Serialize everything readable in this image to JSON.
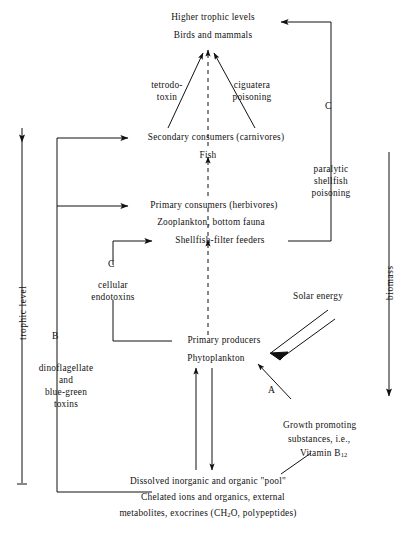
{
  "figure": {
    "type": "flow-diagram",
    "background": "#ffffff",
    "ink": "#111111"
  },
  "axes": {
    "left": {
      "label": "trophic level",
      "direction": "up"
    },
    "right": {
      "label": "biomass",
      "direction": "down"
    }
  },
  "nodes": {
    "higher_trophic": "Higher trophic levels",
    "birds_mammals": "Birds and mammals",
    "secondary_consumers": "Secondary consumers (carnivores)",
    "fish": "Fish",
    "primary_consumers": "Primary consumers (herbivores)",
    "zooplankton": "Zooplankton, bottom fauna",
    "shellfish_filter": "Shellfish-filter feeders",
    "primary_producers": "Primary producers",
    "phytoplankton": "Phytoplankton",
    "pool_line1": "Dissolved inorganic and organic \"pool\"",
    "pool_line2": "Chelated ions and organics, external",
    "pool_line3_pre": "metabolites, exocrines (CH",
    "pool_line3_sub": "2",
    "pool_line3_post": "O, polypeptides)"
  },
  "toxins": {
    "tetrodotoxin_l1": "tetrodo-",
    "tetrodotoxin_l2": "toxin",
    "ciguatera_l1": "ciguatera",
    "ciguatera_l2": "poisoning",
    "paralytic_l1": "paralytic",
    "paralytic_l2": "shellfish",
    "paralytic_l3": "poisoning",
    "cellular_l1": "cellular",
    "cellular_l2": "endotoxins",
    "dino_l1": "dinoflagellate",
    "dino_l2": "and",
    "dino_l3": "blue-green",
    "dino_l4": "toxins"
  },
  "inputs": {
    "solar_energy": "Solar energy",
    "growth_l1": "Growth promoting",
    "growth_l2": "substances, i.e.,",
    "growth_l3_pre": "Vitamin B",
    "growth_l3_sub": "12"
  },
  "pathway_tags": {
    "a": "A",
    "b": "B",
    "c_left": "C",
    "c_right": "C"
  }
}
